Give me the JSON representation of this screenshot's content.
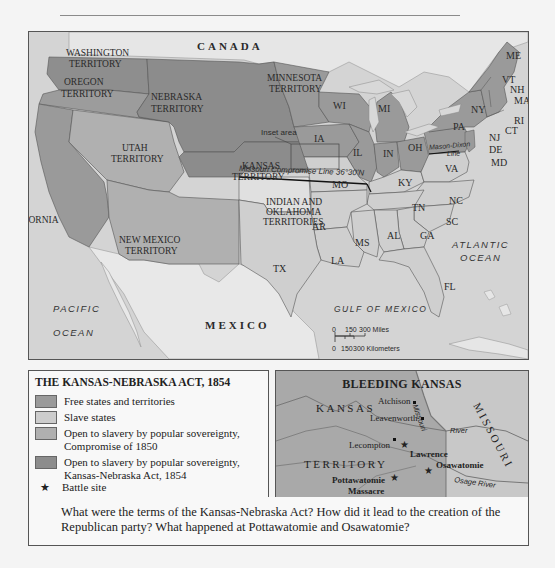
{
  "map": {
    "labels": {
      "canada": "CANADA",
      "mexico": "MEXICO",
      "pacific_1": "PACIFIC",
      "pacific_2": "OCEAN",
      "atlantic_1": "ATLANTIC",
      "atlantic_2": "OCEAN",
      "gulf": "GULF OF MEXICO",
      "washington_1": "WASHINGTON",
      "washington_2": "TERRITORY",
      "oregon_1": "OREGON",
      "oregon_2": "TERRITORY",
      "california": "CALIFORNIA",
      "utah_1": "UTAH",
      "utah_2": "TERRITORY",
      "newmexico_1": "NEW MEXICO",
      "newmexico_2": "TERRITORY",
      "nebraska_1": "NEBRASKA",
      "nebraska_2": "TERRITORY",
      "minnesota_1": "MINNESOTA",
      "minnesota_2": "TERRITORY",
      "kansas_1": "KANSAS",
      "kansas_2": "TERRITORY",
      "indian_1": "INDIAN AND",
      "indian_2": "OKLAHOMA",
      "indian_3": "TERRITORIES",
      "inset_area": "Inset area",
      "missouri_compromise": "Missouri Compromise Line 36°30'N",
      "mason_dixon_1": "Mason-Dixon",
      "mason_dixon_2": "Line",
      "states": {
        "WI": "WI",
        "MI": "MI",
        "IA": "IA",
        "IL": "IL",
        "IN": "IN",
        "OH": "OH",
        "PA": "PA",
        "NY": "NY",
        "VT": "VT",
        "NH": "NH",
        "ME": "ME",
        "MA": "MA",
        "RI": "RI",
        "CT": "CT",
        "NJ": "NJ",
        "DE": "DE",
        "MD": "MD",
        "VA": "VA",
        "KY": "KY",
        "MO": "MO",
        "TN": "TN",
        "NC": "NC",
        "SC": "SC",
        "GA": "GA",
        "AL": "AL",
        "MS": "MS",
        "LA": "LA",
        "AR": "AR",
        "TX": "TX",
        "FL": "FL"
      }
    },
    "scale": {
      "miles": [
        "0",
        "150",
        "300 Miles"
      ],
      "km": [
        "0",
        "150",
        "300 Kilometers"
      ]
    },
    "colors": {
      "free": "#9a9a9a",
      "slave": "#cfcfcf",
      "compromise_1850": "#b2b2b2",
      "kansas_nebraska": "#8e8e8e",
      "foreign": "#e4e4e4",
      "water": "#d2d2d2"
    }
  },
  "legend": {
    "title": "THE KANSAS-NEBRASKA ACT, 1854",
    "items": [
      {
        "label_1": "Free states and territories",
        "color": "#9a9a9a"
      },
      {
        "label_1": "Slave states",
        "color": "#cdcdcd"
      },
      {
        "label_1": "Open to slavery by popular sovereignty,",
        "label_2": "Compromise of 1850",
        "color": "#b0b0b0"
      },
      {
        "label_1": "Open to slavery by popular sovereignty,",
        "label_2": "Kansas-Nebraska Act, 1854",
        "color": "#8c8c8c"
      }
    ],
    "battle_site": "Battle site"
  },
  "inset": {
    "title": "BLEEDING KANSAS",
    "kansas": "KANSAS",
    "territory": "TERRITORY",
    "missouri": "MISSOURI",
    "places": {
      "atchison": "Atchison",
      "leavenworth": "Leavenworth",
      "lecompton": "Lecompton",
      "lawrence": "Lawrence",
      "osawatomie": "Osawatomie",
      "pottawatomie_1": "Pottawatomie",
      "pottawatomie_2": "Massacre"
    },
    "rivers": {
      "missouri": "Missouri",
      "river": "River",
      "osage": "Osage River"
    }
  },
  "question": "What were the terms of the Kansas-Nebraska Act? How did it lead to the creation of the Republican party? What happened at Pottawatomie and Osawatomie?"
}
